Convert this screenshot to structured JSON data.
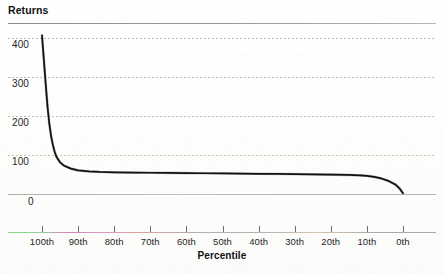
{
  "figure": {
    "y_axis_title": "Returns",
    "x_axis_title": "Percentile"
  },
  "chart_data": {
    "type": "line",
    "title": "Returns",
    "xlabel": "Percentile",
    "ylabel": "Returns",
    "ylim": [
      -60,
      430
    ],
    "xlim": [
      100,
      0
    ],
    "grid": true,
    "grid_style": "dotted",
    "legend": "none",
    "x_tick_labels": [
      "100th",
      "90th",
      "80th",
      "70th",
      "60th",
      "50th",
      "40th",
      "30th",
      "20th",
      "10th",
      "0th"
    ],
    "y_tick_labels": [
      "400",
      "300",
      "200",
      "100",
      "0"
    ],
    "y_ticks": [
      400,
      300,
      200,
      100,
      0
    ],
    "x_ticks": [
      100,
      90,
      80,
      70,
      60,
      50,
      40,
      30,
      20,
      10,
      0
    ],
    "series": [
      {
        "name": "Returns",
        "color": "#111111",
        "x": [
          100,
          99.5,
          99,
          98.5,
          98,
          97.5,
          97,
          96.5,
          96,
          95,
          94,
          92,
          90,
          87,
          84,
          80,
          75,
          70,
          65,
          60,
          55,
          50,
          45,
          40,
          35,
          30,
          25,
          20,
          15,
          12,
          10,
          8,
          6,
          4,
          2,
          1,
          0
        ],
        "values": [
          398,
          330,
          262,
          198,
          148,
          112,
          86,
          66,
          52,
          36,
          27,
          18,
          13,
          10,
          8.5,
          7.5,
          6.8,
          6.2,
          5.8,
          5.3,
          4.8,
          4.3,
          3.8,
          3.3,
          2.8,
          2.3,
          1.7,
          1.0,
          0.0,
          -1.0,
          -2.5,
          -5.5,
          -10,
          -17,
          -28,
          -38,
          -52
        ]
      }
    ],
    "annotations": []
  },
  "axis_ticks": {
    "y": [
      {
        "label": "400",
        "value": 400
      },
      {
        "label": "300",
        "value": 300
      },
      {
        "label": "200",
        "value": 200
      },
      {
        "label": "100",
        "value": 100
      },
      {
        "label": "0",
        "value": 0
      }
    ],
    "x": [
      {
        "label": "100th",
        "value": 100
      },
      {
        "label": "90th",
        "value": 90
      },
      {
        "label": "80th",
        "value": 80
      },
      {
        "label": "70th",
        "value": 70
      },
      {
        "label": "60th",
        "value": 60
      },
      {
        "label": "50th",
        "value": 50
      },
      {
        "label": "40th",
        "value": 40
      },
      {
        "label": "30th",
        "value": 30
      },
      {
        "label": "20th",
        "value": 20
      },
      {
        "label": "10th",
        "value": 10
      },
      {
        "label": "0th",
        "value": 0
      }
    ]
  },
  "colors": {
    "curve": "#111111",
    "gridline": "#969696",
    "gridline_warm": "#a59878",
    "axis": "#6e6e6e",
    "text": "#1f1f1f",
    "background": "#ffffff"
  }
}
